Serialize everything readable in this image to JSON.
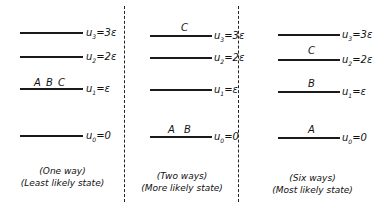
{
  "levels": [
    {
      "name": "u3",
      "symbol": "u",
      "sub": "3",
      "value": "=3ε"
    },
    {
      "name": "u2",
      "symbol": "u",
      "sub": "2",
      "value": "=2ε"
    },
    {
      "name": "u1",
      "symbol": "u",
      "sub": "1",
      "value": "=ε"
    },
    {
      "name": "u0",
      "symbol": "u",
      "sub": "0",
      "value": "=0"
    }
  ],
  "panels": [
    {
      "particles": {
        "u1": "A B C"
      },
      "caption_line1": "(One way)",
      "caption_line2": "(Least likely state)"
    },
    {
      "particles": {
        "u3": "C",
        "u0": "A B"
      },
      "caption_line1": "(Two ways)",
      "caption_line2": "(More likely state)"
    },
    {
      "particles": {
        "u2": "C",
        "u1": "B",
        "u0": "A"
      },
      "caption_line1": "(Six ways)",
      "caption_line2": "(Most likely state)"
    }
  ]
}
